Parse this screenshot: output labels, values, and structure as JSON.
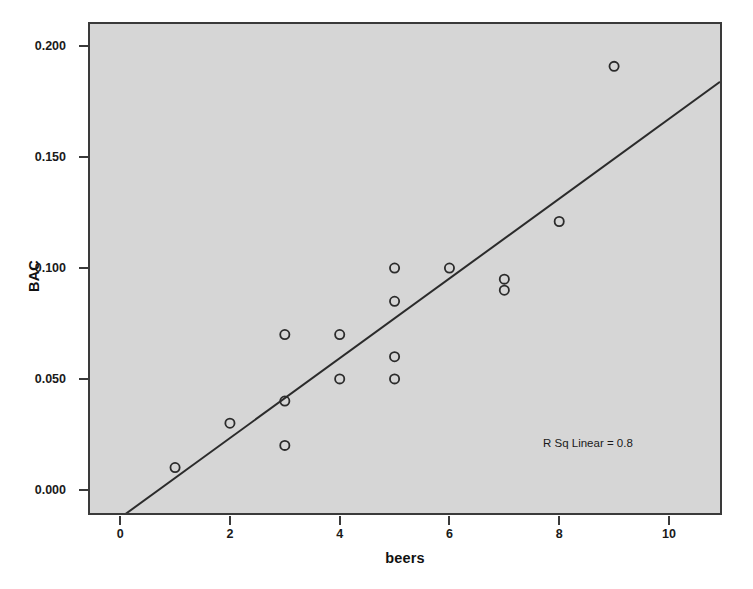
{
  "chart_data": {
    "type": "scatter",
    "title": "",
    "xlabel": "beers",
    "ylabel": "BAC",
    "xlim": [
      -0.55,
      10.93
    ],
    "ylim": [
      -0.0105,
      0.2101
    ],
    "grid": false,
    "legend": "none",
    "x_ticks": [
      "0",
      "2",
      "4",
      "6",
      "8",
      "10"
    ],
    "x_tick_values": [
      0,
      2,
      4,
      6,
      8,
      10
    ],
    "y_ticks": [
      "0.000",
      "0.050",
      "0.100",
      "0.150",
      "0.200"
    ],
    "y_tick_values": [
      0.0,
      0.05,
      0.1,
      0.15,
      0.2
    ],
    "marker": "open-circle",
    "marker_color": "#2b2b2b",
    "plot_background": "#d6d6d6",
    "points": [
      {
        "x": 1,
        "y": 0.01
      },
      {
        "x": 2,
        "y": 0.03
      },
      {
        "x": 3,
        "y": 0.02
      },
      {
        "x": 3,
        "y": 0.04
      },
      {
        "x": 3,
        "y": 0.07
      },
      {
        "x": 4,
        "y": 0.05
      },
      {
        "x": 4,
        "y": 0.07
      },
      {
        "x": 5,
        "y": 0.05
      },
      {
        "x": 5,
        "y": 0.06
      },
      {
        "x": 5,
        "y": 0.085
      },
      {
        "x": 5,
        "y": 0.1
      },
      {
        "x": 6,
        "y": 0.1
      },
      {
        "x": 7,
        "y": 0.09
      },
      {
        "x": 7,
        "y": 0.095
      },
      {
        "x": 8,
        "y": 0.121
      },
      {
        "x": 9,
        "y": 0.191
      }
    ],
    "fit_line": {
      "type": "linear",
      "slope": 0.018,
      "intercept": -0.0127,
      "x_start": -0.55,
      "x_end": 10.93,
      "color": "#2b2b2b"
    },
    "annotations": [
      {
        "text": "R Sq Linear = 0.8",
        "x": 8.0,
        "y": 0.0255
      }
    ]
  },
  "annotation_text": "R Sq Linear = 0.8"
}
